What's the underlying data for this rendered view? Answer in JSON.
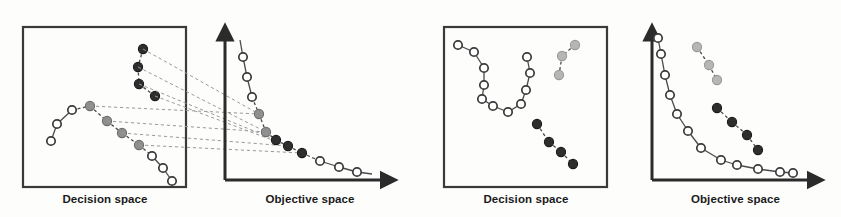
{
  "figure": {
    "background_color": "#fdfdfc",
    "stroke_color": "#2b2b2b",
    "captions": {
      "decision_space_left": "Decision space",
      "objective_space_left": "Objective space",
      "decision_space_right": "Decision space",
      "objective_space_right": "Objective space"
    },
    "marker_styles": {
      "open": {
        "fill": "#ffffff",
        "stroke": "#3a3a3a",
        "label": "open-circle"
      },
      "grey": {
        "fill": "#8f8f8f",
        "stroke": "#6e6e6e",
        "label": "grey-filled-circle"
      },
      "dark": {
        "fill": "#2e2e2e",
        "stroke": "#1c1c1c",
        "label": "dark-filled-circle"
      },
      "light_grey": {
        "fill": "#b6b6b6",
        "stroke": "#9a9a9a",
        "label": "light-grey-filled-circle"
      }
    }
  },
  "chart_data": {
    "type": "scatter",
    "panels": [
      {
        "id": "decision-space-1",
        "label": "Decision space",
        "kind": "boxed-scatter",
        "box": {
          "x": 23,
          "y": 27,
          "width": 163,
          "height": 160
        },
        "series": [
          {
            "name": "dark-cluster",
            "style": "dark",
            "connected": true,
            "points": [
              [
                143,
                49
              ],
              [
                138,
                67
              ],
              [
                139,
                84
              ],
              [
                155,
                96
              ]
            ]
          },
          {
            "name": "open-to-grey-chain-upper",
            "style": "mixed",
            "connected": true,
            "points": [
              [
                51,
                141
              ],
              [
                57,
                124
              ],
              [
                72,
                110
              ],
              [
                90,
                106
              ],
              [
                107,
                121
              ],
              [
                122,
                133
              ],
              [
                139,
                145
              ],
              [
                152,
                156
              ],
              [
                163,
                168
              ],
              [
                172,
                181
              ]
            ],
            "point_styles": [
              "open",
              "open",
              "open",
              "grey",
              "grey",
              "grey",
              "grey",
              "open",
              "open",
              "open"
            ]
          }
        ]
      },
      {
        "id": "objective-space-1",
        "label": "Objective space",
        "kind": "axes-scatter",
        "axes": {
          "origin": [
            225,
            180
          ],
          "x_end": [
            388,
            180
          ],
          "y_end": [
            225,
            33
          ]
        },
        "series": [
          {
            "name": "front-curve",
            "style": "mixed",
            "connected": true,
            "points": [
              [
                240,
                40
              ],
              [
                243,
                57
              ],
              [
                247,
                77
              ],
              [
                252,
                97
              ],
              [
                259,
                114
              ],
              [
                266,
                132
              ],
              [
                276,
                140
              ],
              [
                288,
                146
              ],
              [
                302,
                153
              ],
              [
                320,
                161
              ],
              [
                339,
                167
              ],
              [
                357,
                172
              ],
              [
                372,
                174
              ]
            ],
            "point_styles": [
              "none",
              "open",
              "open",
              "open",
              "grey",
              "grey",
              "dark",
              "dark",
              "dark",
              "open",
              "open",
              "open",
              "none"
            ]
          }
        ]
      },
      {
        "id": "decision-space-2",
        "label": "Decision space",
        "kind": "boxed-scatter",
        "box": {
          "x": 444,
          "y": 27,
          "width": 163,
          "height": 160
        },
        "series": [
          {
            "name": "v-shaped-open-chain",
            "style": "open",
            "connected": true,
            "points": [
              [
                458,
                45
              ],
              [
                474,
                52
              ],
              [
                484,
                68
              ],
              [
                484,
                85
              ],
              [
                482,
                99
              ],
              [
                493,
                106
              ],
              [
                508,
                112
              ],
              [
                521,
                104
              ],
              [
                526,
                90
              ],
              [
                530,
                73
              ],
              [
                527,
                57
              ]
            ]
          },
          {
            "name": "light-grey-chain",
            "style": "light_grey",
            "connected": true,
            "points": [
              [
                575,
                45
              ],
              [
                562,
                56
              ],
              [
                559,
                75
              ]
            ]
          },
          {
            "name": "dark-chain",
            "style": "dark",
            "connected": true,
            "points": [
              [
                537,
                124
              ],
              [
                549,
                142
              ],
              [
                561,
                152
              ],
              [
                573,
                164
              ]
            ]
          }
        ]
      },
      {
        "id": "objective-space-2",
        "label": "Objective space",
        "kind": "axes-scatter",
        "axes": {
          "origin": [
            652,
            180
          ],
          "x_end": [
            815,
            180
          ],
          "y_end": [
            652,
            33
          ]
        },
        "series": [
          {
            "name": "front-curve-open",
            "style": "open",
            "connected": true,
            "points": [
              [
                658,
                38
              ],
              [
                661,
                54
              ],
              [
                665,
                75
              ],
              [
                670,
                95
              ],
              [
                677,
                114
              ],
              [
                688,
                131
              ],
              [
                701,
                148
              ],
              [
                721,
                160
              ],
              [
                737,
                165
              ],
              [
                758,
                169
              ],
              [
                780,
                172
              ],
              [
                793,
                173
              ]
            ]
          },
          {
            "name": "light-grey-chain",
            "style": "light_grey",
            "connected": true,
            "points": [
              [
                697,
                47
              ],
              [
                709,
                65
              ],
              [
                717,
                80
              ]
            ]
          },
          {
            "name": "dark-chain",
            "style": "dark",
            "connected": true,
            "points": [
              [
                717,
                108
              ],
              [
                732,
                122
              ],
              [
                747,
                135
              ],
              [
                758,
                150
              ]
            ]
          }
        ]
      }
    ],
    "mapping_lines": {
      "description": "dashed correspondence lines from decision space 1 to objective space 1",
      "pairs": [
        [
          [
            143,
            49
          ],
          [
            259,
            114
          ]
        ],
        [
          [
            138,
            67
          ],
          [
            266,
            132
          ]
        ],
        [
          [
            139,
            84
          ],
          [
            276,
            140
          ]
        ],
        [
          [
            155,
            96
          ],
          [
            288,
            146
          ]
        ],
        [
          [
            90,
            106
          ],
          [
            259,
            114
          ]
        ],
        [
          [
            107,
            121
          ],
          [
            266,
            132
          ]
        ],
        [
          [
            122,
            133
          ],
          [
            288,
            146
          ]
        ],
        [
          [
            139,
            145
          ],
          [
            302,
            153
          ]
        ]
      ]
    },
    "xlabel": "",
    "ylabel": "",
    "grid": false,
    "legend": "none"
  }
}
